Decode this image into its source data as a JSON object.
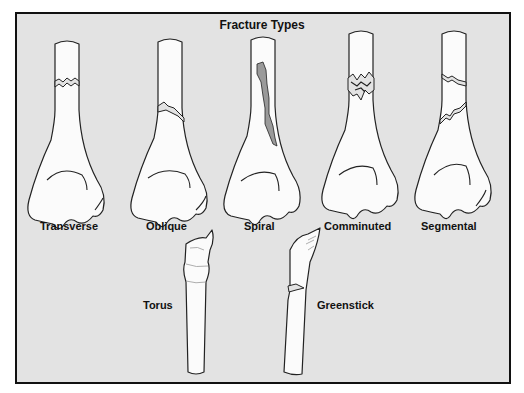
{
  "diagram": {
    "title": "Fracture Types",
    "colors": {
      "background": "#e3e3e3",
      "frame": "#111111",
      "bone_fill": "#fbfbfb",
      "outline": "#222222",
      "fragment_shade": "#9a9a9a"
    },
    "top_row": [
      {
        "label": "Transverse",
        "fracture": "transverse"
      },
      {
        "label": "Oblique",
        "fracture": "oblique"
      },
      {
        "label": "Spiral",
        "fracture": "spiral"
      },
      {
        "label": "Comminuted",
        "fracture": "comminuted"
      },
      {
        "label": "Segmental",
        "fracture": "segmental"
      }
    ],
    "bottom_row": [
      {
        "label": "Torus",
        "fracture": "torus"
      },
      {
        "label": "Greenstick",
        "fracture": "greenstick"
      }
    ]
  }
}
